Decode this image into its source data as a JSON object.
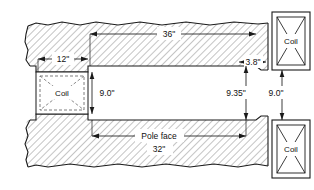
{
  "figure": {
    "type": "engineering-cross-section",
    "title_text": "",
    "background_color": "#ffffff",
    "line_color": "#1a1a1a",
    "hatch_color": "#8a8a8a",
    "text_color": "#111111"
  },
  "dimensions": [
    {
      "id": "coil-width",
      "label": "12\"",
      "orientation": "horizontal",
      "value": 12,
      "unit": "inch"
    },
    {
      "id": "pole-length",
      "label": "36\"",
      "orientation": "horizontal",
      "value": 36,
      "unit": "inch"
    },
    {
      "id": "chamfer",
      "label": "3.8\"",
      "orientation": "horizontal",
      "value": 3.8,
      "unit": "inch"
    },
    {
      "id": "gap-left",
      "label": "9.0\"",
      "orientation": "vertical",
      "value": 9.0,
      "unit": "inch"
    },
    {
      "id": "gap-mid",
      "label": "9.35\"",
      "orientation": "vertical",
      "value": 9.35,
      "unit": "inch"
    },
    {
      "id": "gap-right",
      "label": "9.0\"",
      "orientation": "vertical",
      "value": 9.0,
      "unit": "inch"
    }
  ],
  "annotations": {
    "pole_face_label": "Pole face",
    "pole_face_value": "32\""
  },
  "coils": [
    {
      "id": "coil-left-inner",
      "label": "Coil",
      "style": "dashed"
    },
    {
      "id": "coil-top-right",
      "label": "Coil",
      "style": "solid"
    },
    {
      "id": "coil-bottom-right",
      "label": "Coil",
      "style": "solid"
    }
  ]
}
